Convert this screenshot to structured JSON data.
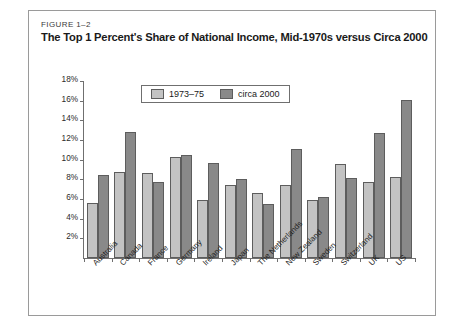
{
  "figure": {
    "number": "FIGURE 1–2",
    "title": "The Top 1 Percent's Share of National Income, Mid-1970s versus Circa 2000"
  },
  "colors": {
    "series1": "#c3c3c3",
    "series2": "#898989",
    "bar_outline": "#5d5d5d",
    "axis": "#6f6f6f",
    "frame": "#9a9a9a",
    "background": "#ffffff"
  },
  "legend": {
    "position": "top-center-inside",
    "entries": [
      {
        "label": "1973–75",
        "swatch": "series1"
      },
      {
        "label": "circa 2000",
        "swatch": "series2"
      }
    ]
  },
  "chart_data": {
    "type": "bar",
    "title": "The Top 1 Percent's Share of National Income, Mid-1970s versus Circa 2000",
    "xlabel": "",
    "ylabel": "",
    "ylim": [
      0,
      18
    ],
    "ytick_labels": [
      "2%",
      "4%",
      "6%",
      "8%",
      "10%",
      "12%",
      "14%",
      "16%",
      "18%"
    ],
    "ytick_values": [
      2,
      4,
      6,
      8,
      10,
      12,
      14,
      16,
      18
    ],
    "grid": false,
    "legend_position": "top-center",
    "categories": [
      "Australia",
      "Canada",
      "France",
      "Germany",
      "Ireland",
      "Japan",
      "The Netherlands",
      "New Zealand",
      "Sweden",
      "Switzerland",
      "UK",
      "US"
    ],
    "series": [
      {
        "name": "1973–75",
        "color": "#c3c3c3",
        "values": [
          5.6,
          8.7,
          8.6,
          10.3,
          5.9,
          7.4,
          6.6,
          7.4,
          5.9,
          9.6,
          7.7,
          8.2
        ]
      },
      {
        "name": "circa 2000",
        "color": "#898989",
        "values": [
          8.4,
          12.8,
          7.7,
          10.5,
          9.7,
          8.0,
          5.5,
          11.1,
          6.2,
          8.1,
          12.7,
          16.1
        ]
      }
    ]
  }
}
